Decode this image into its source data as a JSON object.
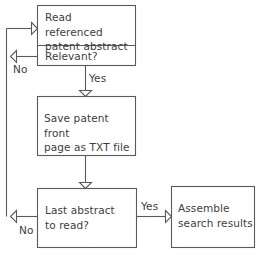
{
  "diagram": {
    "background_color": "#ffffff",
    "line_color": "#5a5a5a",
    "text_color": "#3d3d3d",
    "nodes": [
      {
        "id": "read-abstract",
        "label": "Read referenced\npatent abstract",
        "shape": "rectangle"
      },
      {
        "id": "relevant-decision",
        "label": "Relevant?",
        "shape": "rectangle"
      },
      {
        "id": "save-txt",
        "label": "Save patent front\npage as TXT file",
        "shape": "rectangle"
      },
      {
        "id": "last-abstract-decision",
        "label": "Last abstract\nto read?",
        "shape": "rectangle"
      },
      {
        "id": "assemble-results",
        "label": "Assemble\nsearch results",
        "shape": "rectangle"
      }
    ],
    "edge_labels": {
      "relevant_no": "No",
      "relevant_yes": "Yes",
      "last_abstract_no": "No",
      "last_abstract_yes": "Yes"
    }
  }
}
